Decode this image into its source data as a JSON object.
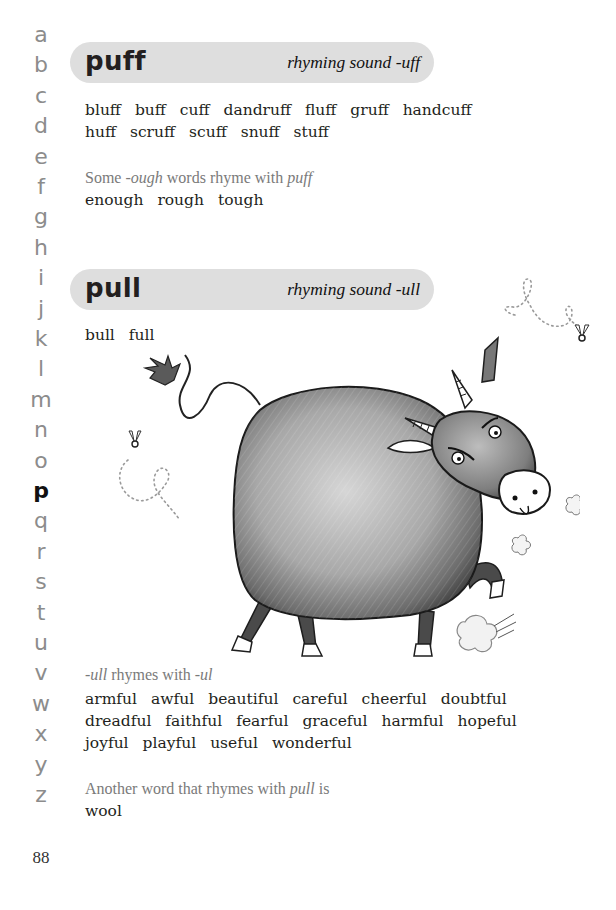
{
  "alphabet_index": {
    "letters": [
      "a",
      "b",
      "c",
      "d",
      "e",
      "f",
      "g",
      "h",
      "i",
      "j",
      "k",
      "l",
      "m",
      "n",
      "o",
      "p",
      "q",
      "r",
      "s",
      "t",
      "u",
      "v",
      "w",
      "x",
      "y",
      "z"
    ],
    "active": "p"
  },
  "page_number": "88",
  "sections": [
    {
      "headword": "puff",
      "rhyming_sound": "rhyming sound -uff",
      "word_lines": [
        [
          "bluff",
          "buff",
          "cuff",
          "dandruff",
          "fluff",
          "gruff",
          "handcuff"
        ],
        [
          "huff",
          "scruff",
          "scuff",
          "snuff",
          "stuff"
        ]
      ],
      "note": {
        "prefix": "Some ",
        "italic1": "-ough",
        "middle": " words rhyme with ",
        "italic2": "puff",
        "suffix": ""
      },
      "note_words": [
        [
          "enough",
          "rough",
          "tough"
        ]
      ]
    },
    {
      "headword": "pull",
      "rhyming_sound": "rhyming sound -ull",
      "word_lines": [
        [
          "bull",
          "full"
        ]
      ],
      "note": {
        "prefix": "",
        "italic1": "-ull",
        "middle": " rhymes with ",
        "italic2": "-ul",
        "suffix": ""
      },
      "note_words": [
        [
          "armful",
          "awful",
          "beautiful",
          "careful",
          "cheerful",
          "doubtful"
        ],
        [
          "dreadful",
          "faithful",
          "fearful",
          "graceful",
          "harmful",
          "hopeful"
        ],
        [
          "joyful",
          "playful",
          "useful",
          "wonderful"
        ]
      ],
      "note2": {
        "prefix": "Another word that rhymes with ",
        "italic1": "pull",
        "suffix": " is"
      },
      "note2_words": [
        [
          "wool"
        ]
      ]
    }
  ],
  "illustration": {
    "subject": "grumpy-bull-cartoon",
    "elements": [
      "bull-body",
      "bull-head",
      "horns",
      "tail-tuft",
      "snort-puffs",
      "dust-cloud",
      "flies"
    ]
  },
  "colors": {
    "pill_background": "#dedede",
    "index_inactive": "#8c8c8c",
    "index_active": "#111111",
    "note_text": "#7a7a7a",
    "body_text": "#231f20"
  }
}
